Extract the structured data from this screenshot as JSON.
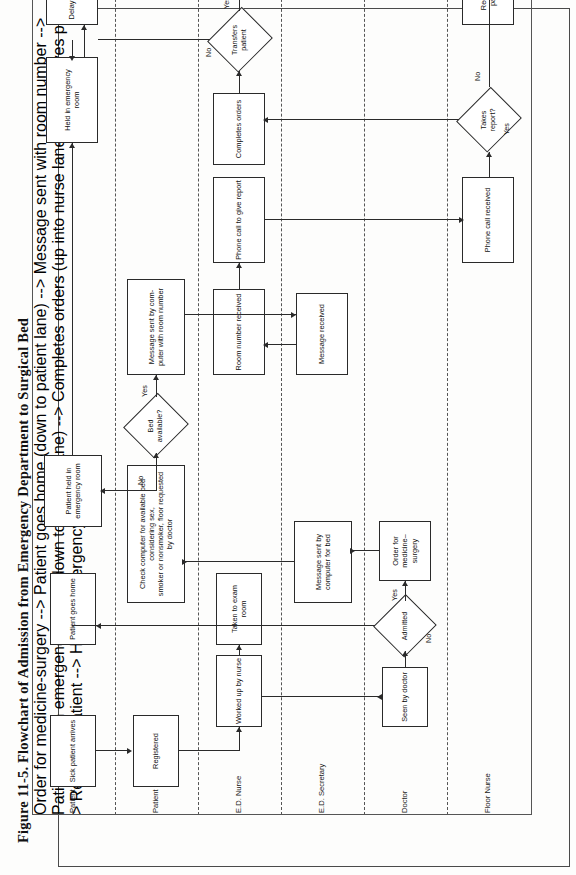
{
  "figure": {
    "caption": "Figure 11-5.  Flowchart of Admission from Emergency Department to Surgical Bed"
  },
  "lanes": [
    {
      "id": "patient",
      "label": "Patient"
    },
    {
      "id": "registration",
      "label": "Patient Registration"
    },
    {
      "id": "ed_nurse",
      "label": "E.D. Nurse"
    },
    {
      "id": "ed_secretary",
      "label": "E.D. Secretary"
    },
    {
      "id": "doctor",
      "label": "Doctor"
    },
    {
      "id": "floor_nurse",
      "label": "Floor Nurse"
    }
  ],
  "nodes": {
    "sick_patient_arrives": "Sick patient arrives",
    "registered": "Registered",
    "worked_up_by_nurse": "Worked up by nurse",
    "taken_to_exam_room": "Taken to exam room",
    "seen_by_doctor": "Seen by doctor",
    "admitted": "Admitted",
    "patient_goes_home": "Patient goes home",
    "order_for_medicine_surgery": "Order for\nmedicine–surgery",
    "message_sent_by_computer_for_bed": "Message sent by\ncomputer for bed",
    "check_computer": "Check computer for available bed considering sex,\nsmoker or nonsmoker, floor requested by doctor",
    "bed_available": "Bed\navailable?",
    "patient_held_in_emergency_room": "Patient held\nin emergency room",
    "message_sent_with_room_number": "Message sent by com-\nputer with room number",
    "message_received": "Message received",
    "room_number_received": "Room number received",
    "phone_call_to_give_report": "Phone call to give report",
    "phone_call_received": "Phone call received",
    "takes_report": "Takes\nreport?",
    "completes_orders": "Completes orders",
    "transfers_patient": "Transfers\npatient",
    "held_in_emergency_room": "Held in emergency room",
    "delay_resolved": "Delay resolved",
    "receives_patient": "Receives patient"
  },
  "edge_labels": {
    "admitted_no": "No",
    "admitted_yes": "Yes",
    "bed_no": "No",
    "bed_yes": "Yes",
    "takes_report_yes": "Yes",
    "takes_report_no": "No",
    "transfers_no": "No",
    "transfers_yes": "Yes"
  },
  "colors": {
    "stroke": "#2a2a2a",
    "lane_rule": "#555555",
    "frame": "#4a4a4a",
    "paper": "#fdfdfc",
    "text": "#111111"
  }
}
